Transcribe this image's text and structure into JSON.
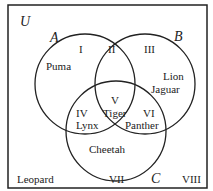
{
  "universe_label": "U",
  "sets": [
    {
      "name": "A",
      "cx": 85,
      "cy": 84,
      "r": 50
    },
    {
      "name": "B",
      "cx": 145,
      "cy": 84,
      "r": 50
    },
    {
      "name": "C",
      "cx": 116,
      "cy": 131,
      "r": 50
    }
  ],
  "regions": [
    {
      "numeral": "I",
      "members": [
        "Puma"
      ]
    },
    {
      "numeral": "II",
      "members": []
    },
    {
      "numeral": "III",
      "members": [
        "Lion",
        "Jaguar"
      ]
    },
    {
      "numeral": "IV",
      "members": [
        "Lynx"
      ]
    },
    {
      "numeral": "V",
      "members": [
        "Tiger"
      ]
    },
    {
      "numeral": "VI",
      "members": [
        "Panther"
      ]
    },
    {
      "numeral": "VII",
      "members": [
        "Cheetah"
      ]
    },
    {
      "numeral": "VIII",
      "members": [
        "Leopard"
      ]
    }
  ],
  "colors": {
    "stroke": "#222222",
    "background": "#ffffff"
  }
}
